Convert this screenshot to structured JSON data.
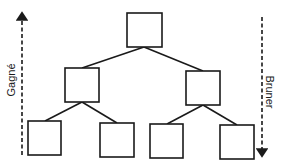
{
  "diagram": {
    "type": "hierarchy-tree",
    "left_axis": {
      "label": "Gagné",
      "direction": "up"
    },
    "right_axis": {
      "label": "Bruner",
      "direction": "down"
    },
    "nodes": [
      {
        "id": "root",
        "x": 127,
        "y": 13,
        "w": 35,
        "h": 34
      },
      {
        "id": "mid-left",
        "x": 65,
        "y": 68,
        "w": 34,
        "h": 34,
        "parent": "root"
      },
      {
        "id": "mid-right",
        "x": 186,
        "y": 71,
        "w": 34,
        "h": 34,
        "parent": "root"
      },
      {
        "id": "leaf-1",
        "x": 28,
        "y": 121,
        "w": 33,
        "h": 34,
        "parent": "mid-left"
      },
      {
        "id": "leaf-2",
        "x": 100,
        "y": 123,
        "w": 34,
        "h": 34,
        "parent": "mid-left"
      },
      {
        "id": "leaf-3",
        "x": 150,
        "y": 124,
        "w": 33,
        "h": 34,
        "parent": "mid-right"
      },
      {
        "id": "leaf-4",
        "x": 220,
        "y": 125,
        "w": 34,
        "h": 34,
        "parent": "mid-right"
      }
    ],
    "colors": {
      "stroke": "#1a1a1a",
      "background": "#ffffff"
    }
  }
}
